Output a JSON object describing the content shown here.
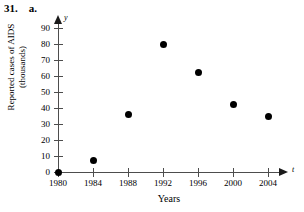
{
  "header": {
    "number": "31.",
    "part": "a."
  },
  "chart_data": {
    "type": "scatter",
    "title": "",
    "xlabel": "Years",
    "ylabel": "Reported cases of AIDS (thousands)",
    "ylabel_line1": "Reported cases of AIDS",
    "ylabel_line2": "(thousands)",
    "x_axis_variable": "t",
    "y_axis_variable": "y",
    "x": [
      1980,
      1984,
      1988,
      1992,
      1996,
      2000,
      2004
    ],
    "values": [
      0,
      7,
      36,
      80,
      62,
      42,
      35
    ],
    "xticks": [
      "1980",
      "1984",
      "1988",
      "1992",
      "1996",
      "2000",
      "2004"
    ],
    "yticks": [
      "0",
      "10",
      "20",
      "30",
      "40",
      "50",
      "60",
      "70",
      "80",
      "90"
    ],
    "xlim": [
      1980,
      2004
    ],
    "ylim": [
      0,
      90
    ],
    "grid": false,
    "legend": false,
    "marker_color": "#000000",
    "axis_color": "#4d4d4d"
  }
}
